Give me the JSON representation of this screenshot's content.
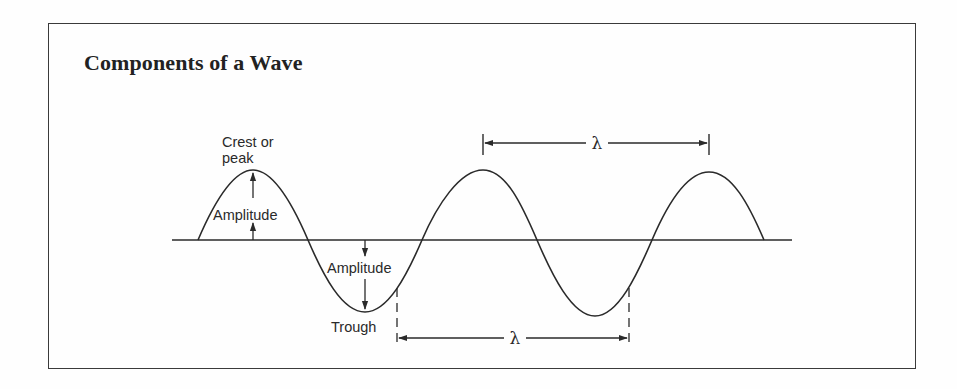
{
  "title": "Components of a Wave",
  "labels": {
    "crest_line1": "Crest or",
    "crest_line2": "peak",
    "amplitude_top": "Amplitude",
    "amplitude_bottom": "Amplitude",
    "trough": "Trough",
    "wavelength_top": "λ",
    "wavelength_bottom": "λ"
  },
  "colors": {
    "ink": "#2a2a2a",
    "background": "#fefefe",
    "frame": "#3a3a3a"
  }
}
